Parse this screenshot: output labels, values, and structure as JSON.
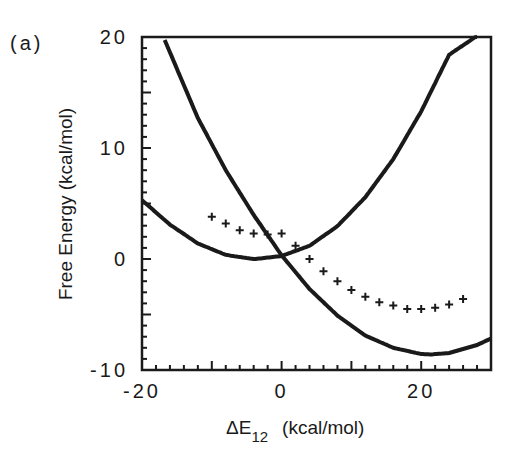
{
  "panel_label": "(a)",
  "colors": {
    "ink": "#1a1a1a",
    "background": "#ffffff"
  },
  "chart_data": {
    "type": "line",
    "title": "",
    "panel": "(a)",
    "xlabel": "ΔE12 (kcal/mol)",
    "xlabel_main": "ΔE",
    "xlabel_sub": "12",
    "xlabel_units": "(kcal/mol)",
    "ylabel": "Free Energy (kcal/mol)",
    "xlim": [
      -20,
      30
    ],
    "ylim": [
      -10,
      20
    ],
    "x_ticks": [
      -20,
      0,
      20
    ],
    "x_tick_labels": [
      "-20",
      "0",
      "20"
    ],
    "y_ticks": [
      -10,
      0,
      10,
      20
    ],
    "y_tick_labels": [
      "-10",
      "0",
      "10",
      "20"
    ],
    "grid": false,
    "legend": null,
    "series": [
      {
        "name": "G1 (diabatic state 1 parabola)",
        "style": "solid-line",
        "x": [
          -20,
          -16,
          -12,
          -8,
          -4,
          -3.7,
          0,
          4,
          8,
          12,
          16,
          20,
          24,
          28
        ],
        "y": [
          5.3,
          3.1,
          1.4,
          0.37,
          0.0,
          0.0,
          0.27,
          1.19,
          2.96,
          5.57,
          9.0,
          13.3,
          18.4,
          20.1
        ]
      },
      {
        "name": "G2 (diabatic state 2 parabola)",
        "style": "solid-line",
        "x": [
          -17,
          -12,
          -8,
          -4,
          0,
          4,
          8,
          12,
          16,
          20,
          21.4,
          24,
          28,
          30
        ],
        "y": [
          20.1,
          12.7,
          8.0,
          3.97,
          0.33,
          -2.7,
          -5.1,
          -6.9,
          -8.0,
          -8.56,
          -8.6,
          -8.47,
          -7.75,
          -7.16
        ]
      },
      {
        "name": "Simulated free energy points",
        "style": "cross-markers",
        "x": [
          -10,
          -8,
          -6,
          -4,
          -2,
          0,
          2,
          4,
          6,
          8,
          10,
          12,
          14,
          16,
          18,
          20,
          22,
          24,
          26
        ],
        "y": [
          3.8,
          3.2,
          2.6,
          2.3,
          2.2,
          2.3,
          1.2,
          0.0,
          -1.1,
          -2.0,
          -2.8,
          -3.4,
          -3.9,
          -4.2,
          -4.5,
          -4.5,
          -4.4,
          -4.1,
          -3.6
        ]
      }
    ]
  }
}
